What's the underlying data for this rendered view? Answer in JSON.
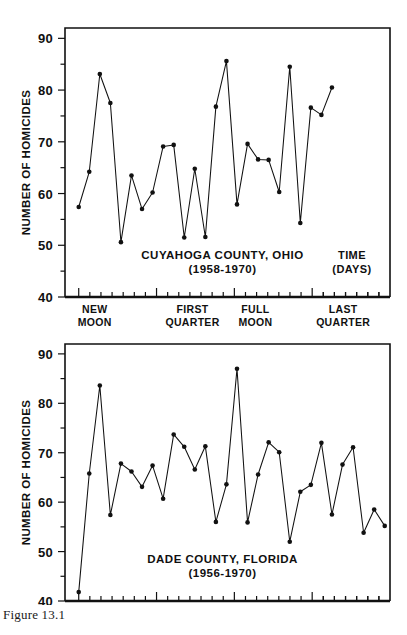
{
  "figure": {
    "caption": "Figure 13.1"
  },
  "axes": {
    "y_label": "NUMBER OF HOMICIDES",
    "y_ticks_major": [
      "40",
      "50",
      "60",
      "70",
      "80",
      "90"
    ],
    "y_ticks_major_values": [
      40,
      50,
      60,
      70,
      80,
      90
    ],
    "y_ticks_minor_values": [
      45,
      55,
      65,
      75,
      85
    ],
    "x_time_label_line1": "TIME",
    "x_time_label_line2": "(DAYS)",
    "phases": [
      {
        "line1": "NEW",
        "line2": "MOON",
        "day": 0
      },
      {
        "line1": "FIRST",
        "line2": "QUARTER",
        "day": 7.375
      },
      {
        "line1": "FULL",
        "line2": "MOON",
        "day": 14.75
      },
      {
        "line1": "LAST",
        "line2": "QUARTER",
        "day": 22.125
      }
    ]
  },
  "chart_data": [
    {
      "type": "line",
      "id": "cuyahoga",
      "title": "CUYAHOGA COUNTY, OHIO",
      "subtitle": "(1958-1970)",
      "xlabel": "TIME (DAYS)",
      "ylabel": "NUMBER OF HOMICIDES",
      "ylim": [
        40,
        92
      ],
      "xlim": [
        -1.3,
        29.5
      ],
      "grid": false,
      "legend": "none",
      "x": [
        0,
        1,
        2,
        3,
        4,
        5,
        6,
        7,
        8,
        9,
        10,
        11,
        12,
        13,
        14,
        15,
        16,
        17,
        18,
        19,
        20,
        21,
        22,
        23,
        24,
        25,
        26,
        27,
        28
      ],
      "values": [
        57.4,
        64.2,
        83.1,
        77.5,
        50.6,
        63.5,
        57.0,
        60.2,
        69.1,
        69.4,
        51.5,
        64.8,
        51.6,
        76.8,
        85.6,
        57.9,
        69.6,
        66.6,
        66.5,
        60.3,
        84.5,
        54.3,
        76.6,
        75.2,
        80.5
      ],
      "categories": null,
      "marker": "filled-circle"
    },
    {
      "type": "line",
      "id": "dade",
      "title": "DADE COUNTY, FLORIDA",
      "subtitle": "(1956-1970)",
      "xlabel": "",
      "ylabel": "NUMBER OF HOMICIDES",
      "ylim": [
        40,
        92
      ],
      "xlim": [
        -1.3,
        29.5
      ],
      "grid": false,
      "legend": "none",
      "x": [
        0,
        1,
        2,
        3,
        4,
        5,
        6,
        7,
        8,
        9,
        10,
        11,
        12,
        13,
        14,
        15,
        16,
        17,
        18,
        19,
        20,
        21,
        22,
        23,
        24,
        25,
        26,
        27,
        28,
        29
      ],
      "values": [
        41.8,
        65.8,
        83.6,
        57.4,
        67.8,
        66.2,
        63.1,
        67.4,
        60.7,
        73.7,
        71.2,
        66.6,
        71.3,
        56.0,
        63.6,
        87.0,
        55.9,
        65.6,
        72.1,
        70.1,
        52.0,
        62.1,
        63.5,
        72.0,
        57.5,
        67.6,
        71.1,
        53.8,
        58.5,
        55.2
      ],
      "categories": null,
      "marker": "filled-circle"
    }
  ],
  "colors": {
    "ink": "#111111",
    "background": "#ffffff"
  }
}
